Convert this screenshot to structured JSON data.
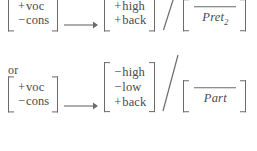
{
  "figure": {
    "type": "phonological-rule-disjunction",
    "connective": "or",
    "rules": [
      {
        "id": "rule-1",
        "input": {
          "features": [
            {
              "sign": "+",
              "name": "voc"
            },
            {
              "sign": "−",
              "name": "cons"
            }
          ]
        },
        "operator": "→",
        "output": {
          "features": [
            {
              "sign": "+",
              "name": "high"
            },
            {
              "sign": "+",
              "name": "back"
            }
          ]
        },
        "separator": "/",
        "environment": {
          "focus_bar": "____",
          "label": "Pret",
          "label_subscript": "2"
        }
      },
      {
        "id": "rule-2",
        "input": {
          "features": [
            {
              "sign": "+",
              "name": "voc"
            },
            {
              "sign": "−",
              "name": "cons"
            }
          ]
        },
        "operator": "→",
        "output": {
          "features": [
            {
              "sign": "−",
              "name": "high"
            },
            {
              "sign": "−",
              "name": "low"
            },
            {
              "sign": "+",
              "name": "back"
            }
          ]
        },
        "separator": "/",
        "environment": {
          "focus_bar": "____",
          "label": "Part",
          "label_subscript": ""
        }
      }
    ],
    "colors": {
      "ink": "#4a4a4a",
      "rule_line": "#6b6b6b",
      "background": "#ffffff"
    }
  }
}
